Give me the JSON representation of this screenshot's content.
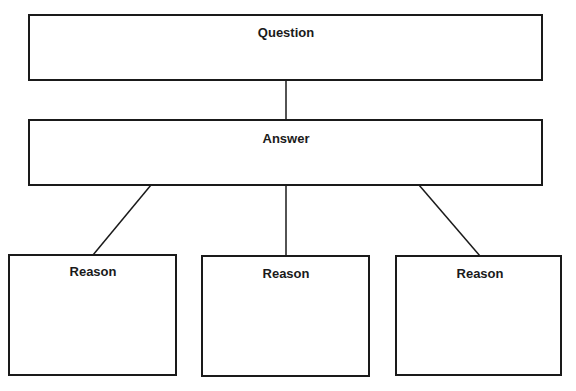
{
  "diagram": {
    "type": "tree",
    "nodes": {
      "question": {
        "label": "Question",
        "x": 29,
        "y": 15,
        "w": 513,
        "h": 65,
        "label_x": 286,
        "label_y": 37
      },
      "answer": {
        "label": "Answer",
        "x": 29,
        "y": 120,
        "w": 513,
        "h": 65,
        "label_x": 286,
        "label_y": 143
      },
      "reasons": [
        {
          "label": "Reason",
          "x": 9,
          "y": 255,
          "w": 167,
          "h": 120,
          "label_x": 93,
          "label_y": 276
        },
        {
          "label": "Reason",
          "x": 202,
          "y": 256,
          "w": 167,
          "h": 120,
          "label_x": 286,
          "label_y": 278
        },
        {
          "label": "Reason",
          "x": 396,
          "y": 256,
          "w": 165,
          "h": 119,
          "label_x": 480,
          "label_y": 278
        }
      ]
    },
    "edges": [
      {
        "from": "question",
        "to": "answer",
        "x1": 286,
        "y1": 80,
        "x2": 286,
        "y2": 120
      },
      {
        "from": "answer",
        "to": "reason-1",
        "x1": 151,
        "y1": 185,
        "x2": 93,
        "y2": 255
      },
      {
        "from": "answer",
        "to": "reason-2",
        "x1": 286,
        "y1": 185,
        "x2": 286,
        "y2": 256
      },
      {
        "from": "answer",
        "to": "reason-3",
        "x1": 419,
        "y1": 185,
        "x2": 480,
        "y2": 256
      }
    ],
    "colors": {
      "stroke": "#1a1a1a",
      "fill": "#ffffff",
      "text": "#1a1a1a"
    }
  }
}
